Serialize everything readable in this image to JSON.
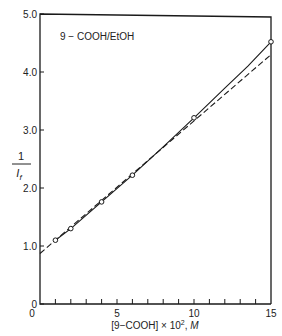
{
  "chart_data": {
    "type": "line",
    "title": "",
    "annotation": "9 − COOH/EtOH",
    "xlabel": "[9−COOH] × 10², M",
    "xlabel_parts": {
      "main": "[9−COOH] × 10",
      "sup": "2",
      "sep": ", ",
      "unit": "M"
    },
    "ylabel": "1 / I_f",
    "ylabel_parts": {
      "numerator": "1",
      "denominator": "I",
      "sub": "f"
    },
    "xlim": [
      0,
      15
    ],
    "ylim": [
      0,
      5.0
    ],
    "x_ticks_major": [
      0,
      5,
      10,
      15
    ],
    "x_tick_labels": [
      "0",
      "5",
      "10",
      "15"
    ],
    "x_ticks_minor": [
      1,
      2,
      3,
      4,
      6,
      7,
      8,
      9,
      11,
      12,
      13,
      14
    ],
    "y_ticks": [
      0,
      1.0,
      2.0,
      3.0,
      4.0,
      5.0
    ],
    "y_tick_labels": [
      "0",
      "1.0",
      "2.0",
      "3.0",
      "4.0",
      "5.0"
    ],
    "grid": false,
    "legend": null,
    "series": [
      {
        "name": "measured points",
        "style": "open-circle markers",
        "x": [
          1,
          2,
          4,
          6,
          10,
          15
        ],
        "y": [
          1.1,
          1.3,
          1.76,
          2.22,
          3.21,
          4.52
        ]
      },
      {
        "name": "fitted curve (solid)",
        "style": "solid",
        "x": [
          1,
          2,
          4,
          6,
          8,
          10,
          12,
          13.5,
          15
        ],
        "y": [
          1.1,
          1.3,
          1.76,
          2.22,
          2.71,
          3.21,
          3.72,
          4.1,
          4.52
        ]
      },
      {
        "name": "linear extrapolation (dashed)",
        "style": "dashed",
        "x": [
          0,
          1,
          15
        ],
        "y": [
          0.87,
          1.1,
          4.3
        ]
      }
    ]
  }
}
